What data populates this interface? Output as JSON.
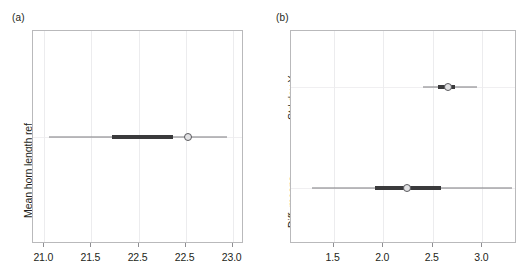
{
  "figure": {
    "panels": [
      {
        "tag": "(a)",
        "ylabel": "Mean horn length ref",
        "xticks": [
          "21.0",
          "21.5",
          "22.5",
          "22.5",
          "23.0"
        ],
        "xtick_values": [
          21.0,
          21.5,
          22.0,
          22.5,
          23.0
        ],
        "xlim": [
          20.88,
          23.12
        ],
        "rows": [
          {
            "name": "Mean horn length ref",
            "point": 22.53,
            "inner_low": 21.72,
            "inner_high": 22.37,
            "outer_low": 21.05,
            "outer_high": 22.94
          }
        ]
      },
      {
        "tag": "(b)",
        "ylabels": [
          "Std.dev Y",
          "Diff. means"
        ],
        "xticks": [
          "1.5",
          "2.0",
          "2.5",
          "3.0"
        ],
        "xtick_values": [
          1.5,
          2.0,
          2.5,
          3.0
        ],
        "xlim": [
          1.07,
          3.35
        ],
        "rows": [
          {
            "name": "Std.dev Y",
            "point": 2.65,
            "inner_low": 2.55,
            "inner_high": 2.73,
            "outer_low": 2.4,
            "outer_high": 2.95
          },
          {
            "name": "Diff. means",
            "point": 2.24,
            "inner_low": 1.92,
            "inner_high": 2.58,
            "outer_low": 1.28,
            "outer_high": 3.3
          }
        ]
      }
    ]
  },
  "chart_data": {
    "type": "scatter",
    "title": "",
    "panels": [
      {
        "label": "(a)",
        "xlabel": "",
        "ylabel": "Mean horn length ref",
        "xlim": [
          20.88,
          23.12
        ],
        "xticks": [
          21.0,
          21.5,
          22.0,
          22.5,
          23.0
        ],
        "xticklabels": [
          "21.0",
          "21.5",
          "22.5",
          "22.5",
          "23.0"
        ],
        "grid": true,
        "legend": "none",
        "series": [
          {
            "name": "Mean horn length ref",
            "point_estimate": 22.53,
            "inner_interval": [
              21.72,
              22.37
            ],
            "outer_interval": [
              21.05,
              22.94
            ]
          }
        ]
      },
      {
        "label": "(b)",
        "xlabel": "",
        "ylabel": "",
        "xlim": [
          1.07,
          3.35
        ],
        "xticks": [
          1.5,
          2.0,
          2.5,
          3.0
        ],
        "xticklabels": [
          "1.5",
          "2.0",
          "2.5",
          "3.0"
        ],
        "grid": true,
        "legend": "none",
        "categories": [
          "Std.dev Y",
          "Diff. means"
        ],
        "series": [
          {
            "name": "Std.dev Y",
            "point_estimate": 2.65,
            "inner_interval": [
              2.55,
              2.73
            ],
            "outer_interval": [
              2.4,
              2.95
            ]
          },
          {
            "name": "Diff. means",
            "point_estimate": 2.24,
            "inner_interval": [
              1.92,
              2.58
            ],
            "outer_interval": [
              1.28,
              3.3
            ]
          }
        ]
      }
    ]
  }
}
